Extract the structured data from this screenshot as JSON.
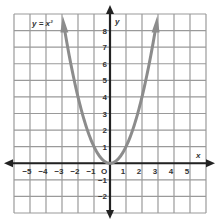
{
  "chart_data": {
    "type": "line",
    "title": "y = x²",
    "xlabel": "x",
    "ylabel": "y",
    "xlim": [
      -6,
      6
    ],
    "ylim": [
      -3,
      9
    ],
    "grid": true,
    "x_ticks": [
      "−5",
      "−4",
      "−3",
      "−2",
      "−1",
      "O",
      "1",
      "2",
      "3",
      "4",
      "5"
    ],
    "y_ticks": [
      "8",
      "7",
      "6",
      "5",
      "4",
      "3",
      "2",
      "1",
      "−1",
      "−2"
    ],
    "series": [
      {
        "name": "y = x²",
        "x": [
          -2.9,
          -2.5,
          -2,
          -1.5,
          -1,
          -0.5,
          0,
          0.5,
          1,
          1.5,
          2,
          2.5,
          2.9
        ],
        "y": [
          8.41,
          6.25,
          4,
          2.25,
          1,
          0.25,
          0,
          0.25,
          1,
          2.25,
          4,
          6.25,
          8.41
        ]
      }
    ],
    "colors": {
      "grid": "#9a9a9a",
      "axes": "#222222",
      "curve": "#8c8c8c"
    }
  },
  "labels": {
    "equation": "y = x²",
    "x_axis": "x",
    "y_axis": "y",
    "origin": "O"
  }
}
